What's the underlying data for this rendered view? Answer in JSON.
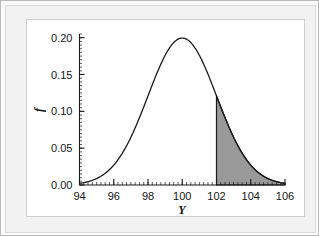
{
  "chart_data": {
    "type": "area",
    "title": "",
    "subtitle": "",
    "xlabel": "Y",
    "ylabel": "f",
    "xlim": [
      94,
      106
    ],
    "ylim": [
      0.0,
      0.205
    ],
    "grid": false,
    "legend": null,
    "distribution": {
      "name": "normal",
      "mean": 100,
      "sd": 2,
      "peak_density": 0.1995
    },
    "x_ticks": [
      94,
      96,
      98,
      100,
      102,
      104,
      106
    ],
    "x_tick_labels": [
      "94",
      "96",
      "98",
      "100",
      "102",
      "104",
      "106"
    ],
    "x_minor_tick_step": 0.25,
    "y_ticks": [
      0.0,
      0.05,
      0.1,
      0.15,
      0.2
    ],
    "y_tick_labels": [
      "0.00",
      "0.05",
      "0.10",
      "0.15",
      "0.20"
    ],
    "y_minor_tick_step": 0.005,
    "shaded_region": {
      "label": "upper tail",
      "x_from": 102,
      "x_to": 106,
      "fill_color": "#999999",
      "edge_color": "#1a1a1a",
      "boundary_density_at_x_from": 0.121
    },
    "x": [
      94,
      94.25,
      94.5,
      94.75,
      95,
      95.25,
      95.5,
      95.75,
      96,
      96.25,
      96.5,
      96.75,
      97,
      97.25,
      97.5,
      97.75,
      98,
      98.25,
      98.5,
      98.75,
      99,
      99.25,
      99.5,
      99.75,
      100,
      100.25,
      100.5,
      100.75,
      101,
      101.25,
      101.5,
      101.75,
      102,
      102.25,
      102.5,
      102.75,
      103,
      103.25,
      103.5,
      103.75,
      104,
      104.25,
      104.5,
      104.75,
      105,
      105.25,
      105.5,
      105.75,
      106
    ],
    "y": [
      0.0022,
      0.003,
      0.004,
      0.0053,
      0.0069,
      0.0088,
      0.0111,
      0.0139,
      0.0175,
      0.0213,
      0.0258,
      0.031,
      0.0366,
      0.043,
      0.0498,
      0.0573,
      0.0648,
      0.0727,
      0.0806,
      0.0884,
      0.096,
      0.1031,
      0.1097,
      0.1154,
      0.1197,
      0.1232,
      0.1257,
      0.1267,
      0.121,
      0.1154,
      0.1097,
      0.1031,
      0.121,
      0.1031,
      0.096,
      0.0884,
      0.0806,
      0.0727,
      0.0648,
      0.0573,
      0.0498,
      0.043,
      0.0366,
      0.031,
      0.0258,
      0.0213,
      0.0175,
      0.0139,
      0.011
    ],
    "curve_note": "normal pdf mean=100 sd=2 evaluated on x"
  },
  "colors": {
    "shade_fill": "#999999",
    "curve_stroke": "#1a1a1a",
    "axis_stroke": "#1a1a1a",
    "panel_background": "#ffffff",
    "outer_background": "#f2f2f2"
  }
}
